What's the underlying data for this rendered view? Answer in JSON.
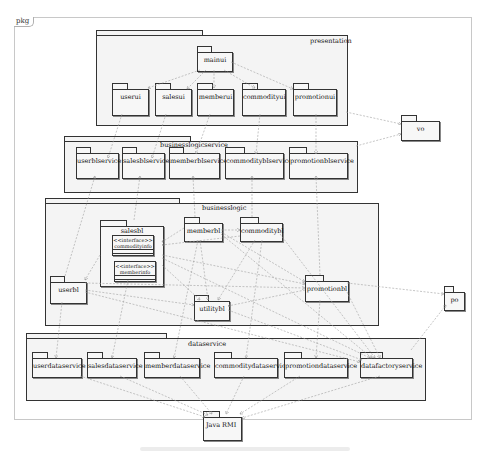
{
  "frame": {
    "label": "pkg"
  },
  "packages": {
    "presentation": {
      "label": "presentation",
      "children": [
        "mainui",
        "userui",
        "salesui",
        "memberui",
        "commodityui",
        "promotionui"
      ]
    },
    "businesslogicservice": {
      "label": "businesslogicservice",
      "children": [
        "userblservice",
        "salesblservice",
        "memberblservice",
        "commodityblservice",
        "promotionblservice"
      ]
    },
    "businesslogic": {
      "label": "businesslogic",
      "children": [
        "salesbl",
        "memberbl",
        "commoditybl",
        "userbl",
        "utilitybl",
        "promotionbl"
      ],
      "salesbl_interfaces": [
        {
          "stereotype": "<<interface>>",
          "name": "commodityinfo"
        },
        {
          "stereotype": "<<interface>>",
          "name": "memberinfo"
        }
      ]
    },
    "dataservice": {
      "label": "dataservice",
      "children": [
        "userdataservice",
        "salesdataservice",
        "memberdataservice",
        "commoditydataservice",
        "promotiondataservice",
        "datafactoryservice"
      ]
    },
    "external": [
      "vo",
      "po",
      "Java  RMI"
    ]
  },
  "labels": {
    "mainui": "mainui",
    "userui": "userui",
    "salesui": "salesui",
    "memberui": "memberui",
    "commodityui": "commodityui",
    "promotionui": "promotionui",
    "userblservice": "userblservice",
    "salesblservice": "salesblservice",
    "memberblservice": "memberblservice",
    "commodityblservice": "commodityblservice",
    "promotionblservice": "promotionblservice",
    "salesbl": "salesbl",
    "memberbl": "memberbl",
    "commoditybl": "commoditybl",
    "userbl": "userbl",
    "utilitybl": "utilitybl",
    "promotionbl": "promotionbl",
    "userdataservice": "userdataservice",
    "salesdataservice": "salesdataservice",
    "memberdataservice": "memberdataservice",
    "commoditydataservice": "commoditydataservice",
    "promotiondataservice": "promotiondataservice",
    "datafactoryservice": "datafactoryservice",
    "vo": "vo",
    "po": "po",
    "javarmi": "Java  RMI",
    "presentation": "presentation",
    "businesslogicservice": "businesslogicservice",
    "businesslogic": "businesslogic",
    "dataservice": "dataservice",
    "iface1_stereotype": "<<interface>>",
    "iface1_name": "commodityinfo",
    "iface2_stereotype": "<<interface>>",
    "iface2_name": "memberinfo"
  },
  "colors": {
    "package_fill": "#f4f4f4",
    "package_border": "#333333",
    "dependency_line": "#9a9a9a",
    "frame_border": "#c8c8c8"
  }
}
